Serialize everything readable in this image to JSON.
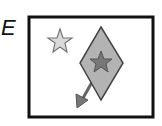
{
  "panel": {
    "label": "E",
    "frame_color": "#111111",
    "shapes": [
      {
        "type": "star",
        "role": "small-star",
        "fill": "#d9d9d9",
        "stroke": "#777777"
      },
      {
        "type": "diamond",
        "role": "diamond",
        "fill": "#b0b0b0",
        "stroke": "#444444"
      },
      {
        "type": "star",
        "role": "inner-star",
        "fill": "#777777",
        "stroke": "#555555"
      },
      {
        "type": "arrow",
        "role": "arrow",
        "color": "#666666"
      }
    ]
  }
}
